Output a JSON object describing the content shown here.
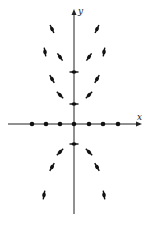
{
  "diagram": {
    "type": "direction-field",
    "axes": {
      "x_label": "x",
      "y_label": "y",
      "color": "#222222"
    },
    "equilibrium_points_on_x_axis": [
      {
        "px": 32,
        "py": 124
      },
      {
        "px": 46,
        "py": 124
      },
      {
        "px": 60,
        "py": 124
      },
      {
        "px": 74,
        "py": 124
      },
      {
        "px": 89,
        "py": 124
      },
      {
        "px": 103,
        "py": 124
      },
      {
        "px": 118,
        "py": 124
      }
    ],
    "slope_marks": [
      {
        "px": 52,
        "py": 29,
        "angle": 65
      },
      {
        "px": 97,
        "py": 29,
        "angle": -65
      },
      {
        "px": 45,
        "py": 52,
        "angle": 80
      },
      {
        "px": 60,
        "py": 57,
        "angle": 55
      },
      {
        "px": 89,
        "py": 57,
        "angle": -55
      },
      {
        "px": 104,
        "py": 52,
        "angle": -80
      },
      {
        "px": 74,
        "py": 72,
        "angle": 0
      },
      {
        "px": 52,
        "py": 79,
        "angle": 60
      },
      {
        "px": 97,
        "py": 79,
        "angle": -60
      },
      {
        "px": 60,
        "py": 95,
        "angle": 45
      },
      {
        "px": 89,
        "py": 95,
        "angle": -45
      },
      {
        "px": 74,
        "py": 104,
        "angle": 0
      },
      {
        "px": 74,
        "py": 144,
        "angle": 0
      },
      {
        "px": 60,
        "py": 152,
        "angle": -45
      },
      {
        "px": 89,
        "py": 152,
        "angle": 45
      },
      {
        "px": 52,
        "py": 167,
        "angle": -60
      },
      {
        "px": 97,
        "py": 167,
        "angle": 60
      },
      {
        "px": 44,
        "py": 195,
        "angle": -80
      },
      {
        "px": 104,
        "py": 195,
        "angle": 80
      }
    ]
  }
}
